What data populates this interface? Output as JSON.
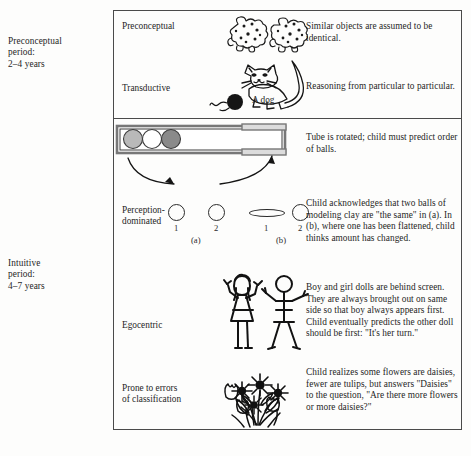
{
  "figure": {
    "periods": [
      {
        "name": "preconceptual-period",
        "line1": "Preconceptual",
        "line2": "period:",
        "line3": "2–4 years"
      },
      {
        "name": "intuitive-period",
        "line1": "Intuitive",
        "line2": "period:",
        "line3": "4–7 years"
      }
    ],
    "rows": [
      {
        "key": "preconceptual",
        "label": "Preconceptual",
        "description": "Similar objects are assumed to be identical.",
        "illustration": "two-similar-blobby-creatures"
      },
      {
        "key": "transductive",
        "label": "Transductive",
        "description": "Reasoning from particular to particular.",
        "illustration": "cat-with-yarn-ball",
        "caption": "A dog"
      },
      {
        "key": "intuitive",
        "label": "Intuitive",
        "description": "Tube is rotated; child must predict order of balls.",
        "illustration": "tube-with-three-balls-and-rotation-arrows",
        "balls": [
          "#b9b9b9",
          "#ffffff",
          "#8a8a8a"
        ]
      },
      {
        "key": "perception-dominated",
        "label_line1": "Perception-",
        "label_line2": "dominated",
        "description": "Child acknowledges that two balls of modeling clay are \"the same\" in (a).  In (b), where one has been flattened, child thinks amount has changed.",
        "illustration": "clay-balls-conservation",
        "marks": {
          "a_ball1": "1",
          "a_ball2": "2",
          "b_ball1": "1",
          "b_ball2": "2",
          "group_a": "(a)",
          "group_b": "(b)"
        }
      },
      {
        "key": "egocentric",
        "label": "Egocentric",
        "description": "Boy and girl dolls are behind screen. They are always brought out on same side so that boy always appears first.  Child eventually predicts the other doll should be first: \"It's her turn.\"",
        "illustration": "girl-doll-and-boy-doll"
      },
      {
        "key": "classification",
        "label_line1": "Prone to errors",
        "label_line2": "of classification",
        "description": "Child realizes some flowers are daisies, fewer are tulips, but answers \"Daisies\" to the question, \"Are there more flowers or more daisies?\"",
        "illustration": "bouquet-of-daisies-and-tulips"
      }
    ],
    "colors": {
      "border": "#4a4a4a",
      "text": "#1f1f1f",
      "ink": "#2a2a2a",
      "ball_light": "#b9b9b9",
      "ball_white": "#ffffff",
      "ball_dark": "#8a8a8a",
      "tube_fill": "#d8d8d8"
    }
  }
}
